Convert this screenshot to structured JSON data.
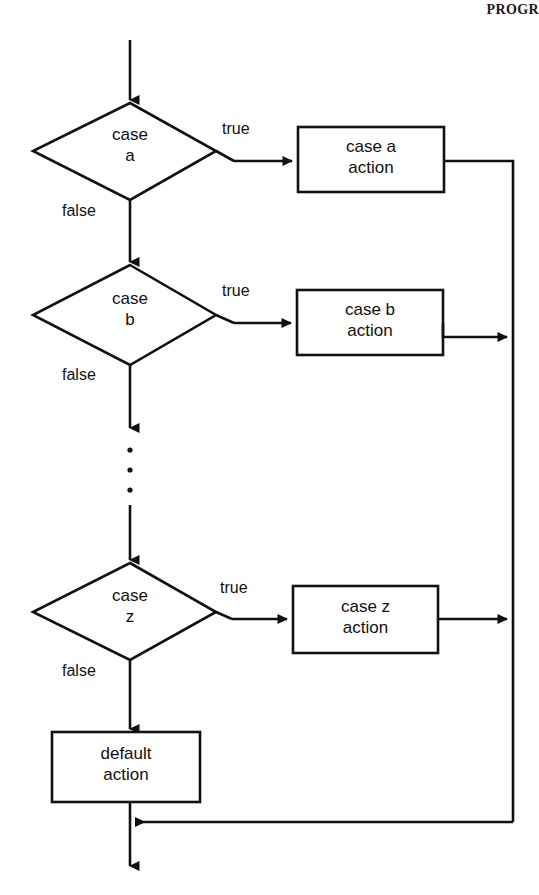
{
  "page": {
    "header_text": "PROGR",
    "diagram_title": "switch / case-chain flowchart",
    "background_color": "#ffffff",
    "stroke_color": "#111111"
  },
  "flowchart": {
    "type": "flowchart",
    "orientation": "top-to-bottom",
    "entry": {
      "name": "entry-arrow"
    },
    "decisions": [
      {
        "id": "case-a",
        "label": "case\na",
        "true_label": "true",
        "false_label": "false"
      },
      {
        "id": "case-b",
        "label": "case\nb",
        "true_label": "true",
        "false_label": "false"
      },
      {
        "id": "case-z",
        "label": "case\nz",
        "true_label": "true",
        "false_label": "false"
      }
    ],
    "actions": [
      {
        "id": "case-a-action",
        "label": "case a\naction"
      },
      {
        "id": "case-b-action",
        "label": "case b\naction"
      },
      {
        "id": "case-z-action",
        "label": "case z\naction"
      },
      {
        "id": "default-action",
        "label": "default\naction"
      }
    ],
    "ellipsis": {
      "id": "vertical-ellipsis",
      "dots": 3
    },
    "exit": {
      "name": "exit-arrow"
    }
  }
}
